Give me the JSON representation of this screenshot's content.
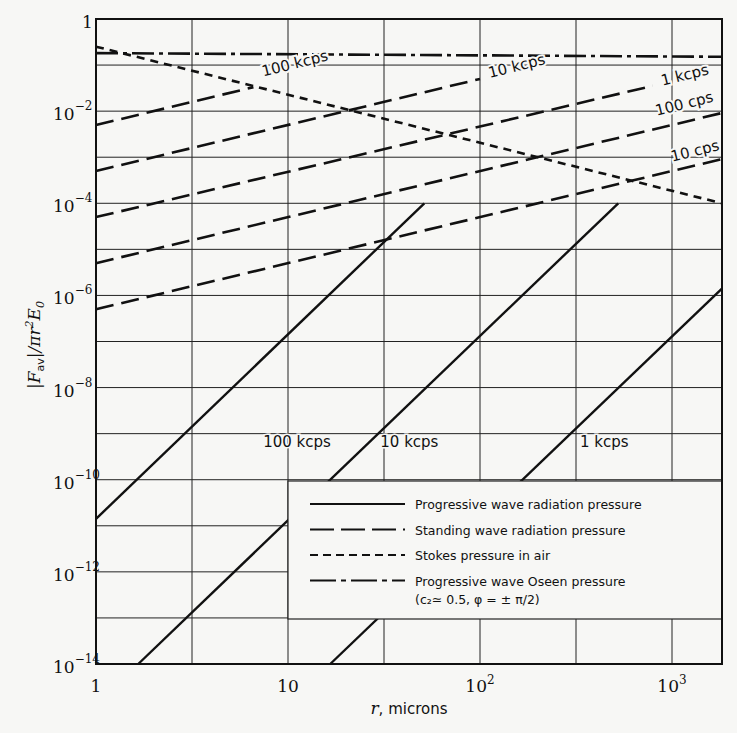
{
  "chart_data": {
    "type": "line",
    "title": "",
    "xlabel": "r, microns",
    "ylabel": "|F_av| / π r² E₀",
    "xscale": "log",
    "yscale": "log",
    "xlim": [
      1,
      1820
    ],
    "ylim": [
      1e-14,
      1
    ],
    "grid": true,
    "x_ticks": [
      {
        "value": 1,
        "label": "1",
        "exp": ""
      },
      {
        "value": 10,
        "label": "10",
        "exp": ""
      },
      {
        "value": 100,
        "label": "10",
        "exp": "2"
      },
      {
        "value": 1000,
        "label": "10",
        "exp": "3"
      }
    ],
    "y_ticks": [
      {
        "value": 0,
        "label": "1",
        "exp": ""
      },
      {
        "value": -2,
        "label": "10",
        "exp": "−2"
      },
      {
        "value": -4,
        "label": "10",
        "exp": "−4"
      },
      {
        "value": -6,
        "label": "10",
        "exp": "−6"
      },
      {
        "value": -8,
        "label": "10",
        "exp": "−8"
      },
      {
        "value": -10,
        "label": "10",
        "exp": "−10"
      },
      {
        "value": -12,
        "label": "10",
        "exp": "−12"
      },
      {
        "value": -14,
        "label": "10",
        "exp": "−14"
      }
    ],
    "legend": {
      "position": "lower right",
      "entries": [
        {
          "style": "solid",
          "label": "Progressive wave radiation pressure"
        },
        {
          "style": "long-dash",
          "label": "Standing wave radiation pressure"
        },
        {
          "style": "short-dash",
          "label": "Stokes pressure in air"
        },
        {
          "style": "dash-dot",
          "label": "Progressive wave Oseen pressure",
          "sublabel": "(c₂≃ 0.5, φ = ± π/2)"
        }
      ]
    },
    "series": [
      {
        "name": "Progressive wave radiation pressure, 100 kcps",
        "style": "solid",
        "label": "100 kcps",
        "points_log10": [
          [
            0,
            -10.85
          ],
          [
            1.71,
            -4.0
          ]
        ],
        "label_at": [
          0.85,
          -9.3
        ]
      },
      {
        "name": "Progressive wave radiation pressure, 10 kcps",
        "style": "solid",
        "label": "10 kcps",
        "points_log10": [
          [
            0.22,
            -14.0
          ],
          [
            2.72,
            -4.0
          ]
        ],
        "label_at": [
          1.46,
          -9.3
        ]
      },
      {
        "name": "Progressive wave radiation pressure, 1 kcps",
        "style": "solid",
        "label": "1 kcps",
        "points_log10": [
          [
            1.22,
            -14.0
          ],
          [
            3.26,
            -5.85
          ]
        ],
        "label_at": [
          2.5,
          -9.3
        ]
      },
      {
        "name": "Standing wave radiation pressure, 100 kcps",
        "style": "long-dash",
        "label": "100 kcps",
        "points_log10": [
          [
            0,
            -2.3
          ],
          [
            0.82,
            -1.48
          ]
        ],
        "label_at": [
          0.85,
          -1.25
        ],
        "label_rotate": -14
      },
      {
        "name": "Standing wave radiation pressure, 10 kcps",
        "style": "long-dash",
        "label": "10 kcps",
        "points_log10": [
          [
            0,
            -3.3
          ],
          [
            2.0,
            -1.3
          ]
        ],
        "label_at": [
          2.03,
          -1.28
        ],
        "label_rotate": -14
      },
      {
        "name": "Standing wave radiation pressure, 1 kcps",
        "style": "long-dash",
        "label": "1 kcps",
        "points_log10": [
          [
            0,
            -4.3
          ],
          [
            2.9,
            -1.45
          ]
        ],
        "label_at": [
          2.93,
          -1.45
        ],
        "label_rotate": -14
      },
      {
        "name": "Standing wave radiation pressure, 100 cps",
        "style": "long-dash",
        "label": "100 cps",
        "points_log10": [
          [
            0,
            -5.3
          ],
          [
            3.26,
            -2.04
          ]
        ],
        "label_at": [
          2.9,
          -2.1
        ],
        "label_rotate": -14
      },
      {
        "name": "Standing wave radiation pressure, 10 cps",
        "style": "long-dash",
        "label": "10 cps",
        "points_log10": [
          [
            0,
            -6.3
          ],
          [
            3.26,
            -3.04
          ]
        ],
        "label_at": [
          2.98,
          -3.1
        ],
        "label_rotate": -14
      },
      {
        "name": "Stokes pressure in air",
        "style": "short-dash",
        "label": "",
        "points_log10": [
          [
            0,
            -0.6
          ],
          [
            3.26,
            -4.0
          ]
        ]
      },
      {
        "name": "Progressive wave Oseen pressure",
        "style": "dash-dot",
        "label": "",
        "points_log10": [
          [
            0,
            -0.74
          ],
          [
            3.26,
            -0.82
          ]
        ]
      }
    ]
  },
  "axes": {
    "x_title_italic": "r",
    "x_title_rest": ", microns",
    "y_title": "|F_av|/πr²E₀"
  }
}
